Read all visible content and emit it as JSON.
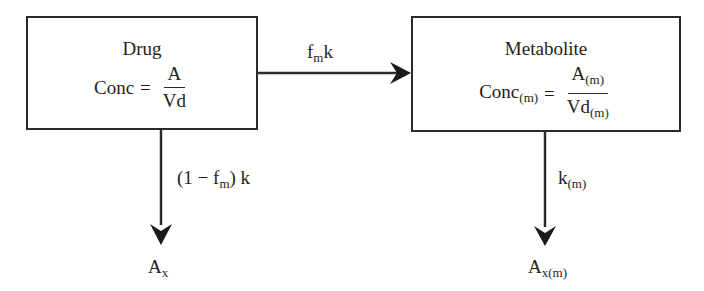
{
  "drug_box": {
    "title": "Drug",
    "conc_label": "Conc",
    "equals": "=",
    "numerator": "A",
    "denominator": "Vd"
  },
  "metabolite_box": {
    "title": "Metabolite",
    "conc_label": "Conc",
    "conc_sub": "(m)",
    "equals": "=",
    "numerator": "A",
    "numerator_sub": "(m)",
    "denominator": "Vd",
    "denominator_sub": "(m)"
  },
  "arrows": {
    "formation": {
      "main": "f",
      "sub": "m",
      "suffix": "k"
    },
    "drug_elimination": {
      "prefix": "(1 − f",
      "sub": "m",
      "suffix": ") k"
    },
    "metabolite_elimination": {
      "main": "k",
      "sub": "(m)"
    }
  },
  "outputs": {
    "drug_excreted": {
      "main": "A",
      "sub": "x"
    },
    "metabolite_excreted": {
      "main": "A",
      "sub": "x(m)"
    }
  },
  "colors": {
    "line": "#2a2a2a",
    "text": "#231f20",
    "background": "#ffffff"
  }
}
